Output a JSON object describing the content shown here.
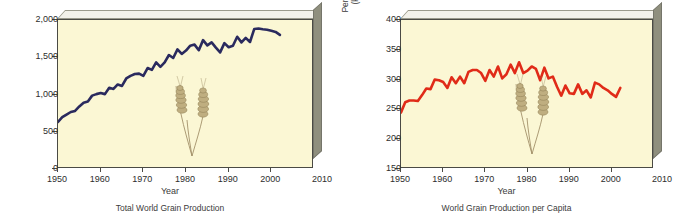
{
  "figure": {
    "background_color": "#ffffff",
    "plot_face_color": "#fbf7d4",
    "box_side_color": "#8f8f7e",
    "box_top_color": "#f2f1ea",
    "wheat_color": "#b8a775"
  },
  "chart_data": [
    {
      "type": "line",
      "id": "total-world-grain-production",
      "title": "Total World Grain Production",
      "xlabel": "Year",
      "ylabel": "Grain production (millions of tons)",
      "ylabel_line1": "Grain production",
      "ylabel_line2": "(millions of tons)",
      "line_color": "#2a2a5e",
      "grid": false,
      "legend": "none",
      "xlim": [
        1950,
        2010
      ],
      "ylim": [
        0,
        2000
      ],
      "xticks": [
        1950,
        1960,
        1970,
        1980,
        1990,
        2000,
        2010
      ],
      "xticklabels": [
        "1950",
        "1960",
        "1970",
        "1980",
        "1990",
        "2000",
        "2010"
      ],
      "yticks": [
        0,
        500,
        1000,
        1500,
        2000
      ],
      "yticklabels": [
        "0",
        "500",
        "1,000",
        "1,500",
        "2,000"
      ],
      "x": [
        1950,
        1951,
        1952,
        1953,
        1954,
        1955,
        1956,
        1957,
        1958,
        1959,
        1960,
        1961,
        1962,
        1963,
        1964,
        1965,
        1966,
        1967,
        1968,
        1969,
        1970,
        1971,
        1972,
        1973,
        1974,
        1975,
        1976,
        1977,
        1978,
        1979,
        1980,
        1981,
        1982,
        1983,
        1984,
        1985,
        1986,
        1987,
        1988,
        1989,
        1990,
        1991,
        1992,
        1993,
        1994,
        1995,
        1996,
        1997,
        1998,
        1999,
        2000,
        2001,
        2002
      ],
      "values": [
        631,
        695,
        730,
        765,
        780,
        840,
        890,
        905,
        985,
        1005,
        1020,
        1005,
        1090,
        1075,
        1135,
        1115,
        1215,
        1250,
        1275,
        1280,
        1250,
        1355,
        1330,
        1430,
        1370,
        1430,
        1530,
        1490,
        1605,
        1545,
        1590,
        1655,
        1670,
        1595,
        1730,
        1660,
        1700,
        1630,
        1565,
        1690,
        1635,
        1655,
        1775,
        1700,
        1760,
        1705,
        1880,
        1885,
        1875,
        1870,
        1855,
        1840,
        1800
      ]
    },
    {
      "type": "line",
      "id": "world-grain-production-per-capita",
      "title": "World Grain Production per Capita",
      "xlabel": "Year",
      "ylabel": "Per capita grain production (kilograms per person)",
      "ylabel_line1": "Per capita grain production",
      "ylabel_line2": "(kilograms per person)",
      "line_color": "#e02b18",
      "grid": false,
      "legend": "none",
      "xlim": [
        1950,
        2010
      ],
      "ylim": [
        150,
        400
      ],
      "xticks": [
        1950,
        1960,
        1970,
        1980,
        1990,
        2000,
        2010
      ],
      "xticklabels": [
        "1950",
        "1960",
        "1970",
        "1980",
        "1990",
        "2000",
        "2010"
      ],
      "yticks": [
        150,
        200,
        250,
        300,
        350,
        400
      ],
      "yticklabels": [
        "150",
        "200",
        "250",
        "300",
        "350",
        "400"
      ],
      "x": [
        1950,
        1951,
        1952,
        1953,
        1954,
        1955,
        1956,
        1957,
        1958,
        1959,
        1960,
        1961,
        1962,
        1963,
        1964,
        1965,
        1966,
        1967,
        1968,
        1969,
        1970,
        1971,
        1972,
        1973,
        1974,
        1975,
        1976,
        1977,
        1978,
        1979,
        1980,
        1981,
        1982,
        1983,
        1984,
        1985,
        1986,
        1987,
        1988,
        1989,
        1990,
        1991,
        1992,
        1993,
        1994,
        1995,
        1996,
        1997,
        1998,
        1999,
        2000,
        2001,
        2002
      ],
      "values": [
        245,
        262,
        265,
        265,
        264,
        274,
        285,
        284,
        300,
        299,
        296,
        286,
        304,
        294,
        305,
        294,
        313,
        316,
        316,
        311,
        298,
        316,
        305,
        322,
        302,
        309,
        325,
        311,
        329,
        311,
        315,
        322,
        318,
        299,
        320,
        302,
        305,
        288,
        273,
        290,
        277,
        276,
        292,
        276,
        282,
        270,
        295,
        292,
        286,
        282,
        276,
        271,
        286
      ]
    }
  ]
}
